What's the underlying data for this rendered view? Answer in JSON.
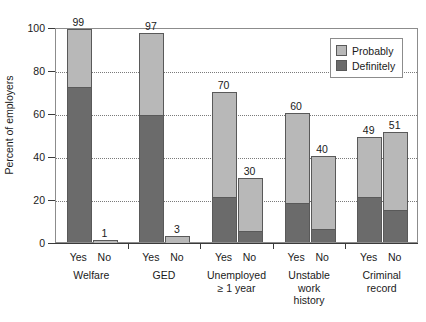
{
  "chart_data": {
    "type": "bar",
    "subtype": "stacked",
    "title": "",
    "xlabel": "",
    "ylabel": "Percent of employers",
    "ylim": [
      0,
      100
    ],
    "yticks": [
      0,
      20,
      40,
      60,
      80,
      100
    ],
    "ytick_labels": [
      "0",
      "20",
      "40",
      "60",
      "80",
      "100"
    ],
    "gridlines": [
      20,
      40,
      60,
      80
    ],
    "grid": true,
    "legend_position": "top-right",
    "legend": [
      {
        "name": "Probably",
        "color": "#b8b8b8"
      },
      {
        "name": "Definitely",
        "color": "#6b6b6b"
      }
    ],
    "groups": [
      {
        "label_lines": [
          "Welfare"
        ],
        "bars": [
          {
            "category": "Yes",
            "total": 99,
            "definitely": 72,
            "probably": 27,
            "total_label": "99"
          },
          {
            "category": "No",
            "total": 1,
            "definitely": 0,
            "probably": 1,
            "total_label": "1"
          }
        ]
      },
      {
        "label_lines": [
          "GED"
        ],
        "bars": [
          {
            "category": "Yes",
            "total": 97,
            "definitely": 59,
            "probably": 38,
            "total_label": "97"
          },
          {
            "category": "No",
            "total": 3,
            "definitely": 0,
            "probably": 3,
            "total_label": "3"
          }
        ]
      },
      {
        "label_lines": [
          "Unemployed",
          "≥ 1 year"
        ],
        "bars": [
          {
            "category": "Yes",
            "total": 70,
            "definitely": 21,
            "probably": 49,
            "total_label": "70"
          },
          {
            "category": "No",
            "total": 30,
            "definitely": 5,
            "probably": 25,
            "total_label": "30"
          }
        ]
      },
      {
        "label_lines": [
          "Unstable",
          "work",
          "history"
        ],
        "bars": [
          {
            "category": "Yes",
            "total": 60,
            "definitely": 18,
            "probably": 42,
            "total_label": "60"
          },
          {
            "category": "No",
            "total": 40,
            "definitely": 6,
            "probably": 34,
            "total_label": "40"
          }
        ]
      },
      {
        "label_lines": [
          "Criminal",
          "record"
        ],
        "bars": [
          {
            "category": "Yes",
            "total": 49,
            "definitely": 21,
            "probably": 28,
            "total_label": "49"
          },
          {
            "category": "No",
            "total": 51,
            "definitely": 15,
            "probably": 36,
            "total_label": "51"
          }
        ]
      }
    ],
    "colors": {
      "probably": "#b8b8b8",
      "definitely": "#6b6b6b",
      "bar_outline": "#595959",
      "axis": "#3a3a3a",
      "grid": "#7a7a7a",
      "frame": "#8c8c8c",
      "text": "#1a1a1a",
      "background": "#ffffff"
    }
  }
}
